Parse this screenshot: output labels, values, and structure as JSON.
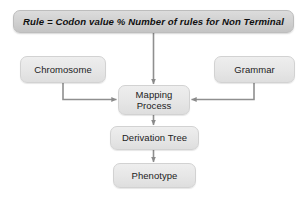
{
  "diagram": {
    "background_color": "#ffffff",
    "node_fill_color": "#e6e6e6",
    "banner_fill_color": "#d2d2d2",
    "connector_color": "#808080",
    "banner": {
      "text": "Rule = Codon value % Number of rules for Non Terminal"
    },
    "nodes": {
      "chromosome": {
        "label": "Chromosome"
      },
      "grammar": {
        "label": "Grammar"
      },
      "mapping": {
        "label": "Mapping\nProcess"
      },
      "derivation": {
        "label": "Derivation Tree"
      },
      "phenotype": {
        "label": "Phenotype"
      }
    }
  }
}
